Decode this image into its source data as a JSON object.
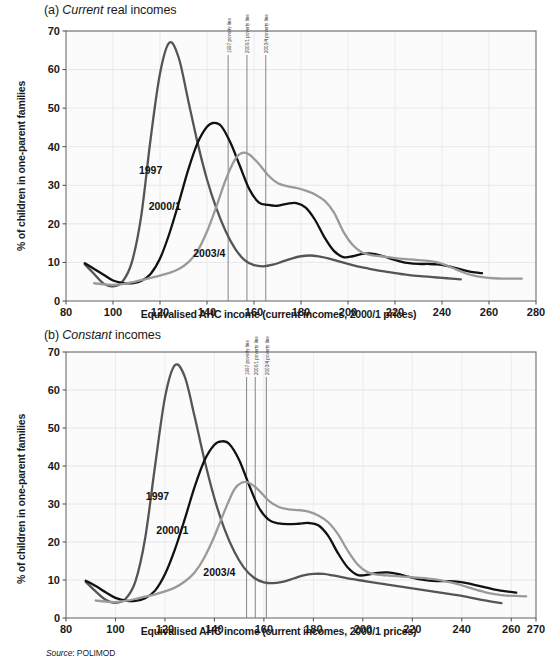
{
  "figure": {
    "source_prefix": "Source",
    "source_value": ": POLIMOD",
    "xlabel": "Equivalised AHC income (current incomes, 2000/1 prices)",
    "ylabel": "% of children in one-parent families"
  },
  "panels": [
    {
      "id": "a",
      "title_prefix": "(a) ",
      "title_italic": "Current",
      "title_rest": " real incomes"
    },
    {
      "id": "b",
      "title_prefix": "(b) ",
      "title_italic": "Constant",
      "title_rest": " incomes"
    }
  ],
  "chart_data": [
    {
      "type": "line",
      "title": "(a) Current real incomes",
      "xlabel": "Equivalised AHC income (current incomes, 2000/1 prices)",
      "ylabel": "% of children in one-parent families",
      "xlim": [
        80,
        280
      ],
      "ylim": [
        0,
        70
      ],
      "xticks": [
        80,
        100,
        120,
        140,
        160,
        180,
        200,
        220,
        240,
        260,
        280
      ],
      "yticks": [
        0,
        10,
        20,
        30,
        40,
        50,
        60,
        70
      ],
      "grid": true,
      "legend": "inline-labels",
      "annotations": [
        {
          "label": "1997 poverty line",
          "x": 149
        },
        {
          "label": "2000/1 poverty line",
          "x": 157
        },
        {
          "label": "2003/4 poverty line",
          "x": 165
        }
      ],
      "series": [
        {
          "name": "1997",
          "color": "#555555",
          "label_x": 116,
          "label_y": 33,
          "x": [
            88,
            92,
            96,
            100,
            104,
            108,
            112,
            116,
            120,
            124,
            128,
            132,
            136,
            140,
            144,
            148,
            152,
            156,
            160,
            164,
            168,
            172,
            176,
            180,
            184,
            188,
            192,
            196,
            200,
            204,
            208,
            212,
            216,
            220,
            224,
            228,
            232,
            236,
            240,
            244,
            248
          ],
          "y": [
            9.5,
            7.0,
            4.5,
            3.8,
            5.0,
            10.0,
            22.0,
            42.0,
            59.0,
            67.0,
            63.0,
            52.0,
            41.0,
            31.5,
            24.0,
            18.0,
            13.5,
            10.6,
            9.3,
            9.0,
            9.4,
            10.2,
            11.0,
            11.6,
            11.8,
            11.5,
            11.0,
            10.3,
            9.6,
            9.0,
            8.5,
            8.0,
            7.6,
            7.2,
            6.9,
            6.6,
            6.4,
            6.2,
            6.0,
            5.8,
            5.6
          ]
        },
        {
          "name": "2000/1",
          "color": "#111111",
          "label_x": 122,
          "label_y": 23.5,
          "x": [
            88,
            92,
            96,
            100,
            104,
            108,
            112,
            116,
            120,
            124,
            128,
            132,
            136,
            140,
            143,
            146,
            150,
            154,
            158,
            162,
            166,
            170,
            174,
            178,
            182,
            186,
            190,
            194,
            198,
            202,
            206,
            210,
            214,
            218,
            222,
            226,
            230,
            234,
            238,
            242,
            246,
            250,
            254,
            257
          ],
          "y": [
            9.8,
            8.3,
            6.8,
            5.3,
            4.7,
            4.6,
            5.2,
            7.0,
            11.0,
            17.5,
            25.5,
            34.0,
            41.0,
            45.2,
            46.2,
            45.4,
            41.0,
            35.0,
            29.0,
            25.6,
            24.9,
            24.7,
            25.2,
            25.4,
            24.2,
            21.0,
            16.5,
            13.0,
            11.4,
            11.6,
            12.2,
            12.3,
            11.8,
            11.0,
            10.3,
            9.8,
            9.6,
            9.6,
            9.5,
            9.1,
            8.5,
            7.9,
            7.4,
            7.2
          ]
        },
        {
          "name": "2003/4",
          "color": "#9a9a9a",
          "label_x": 141,
          "label_y": 11.5,
          "x": [
            92,
            96,
            100,
            104,
            108,
            112,
            116,
            120,
            124,
            128,
            132,
            136,
            140,
            144,
            148,
            152,
            155,
            158,
            162,
            166,
            170,
            174,
            178,
            182,
            186,
            190,
            194,
            198,
            202,
            206,
            210,
            214,
            218,
            222,
            226,
            230,
            234,
            238,
            242,
            246,
            250,
            254,
            258,
            262,
            266,
            270,
            274
          ],
          "y": [
            4.6,
            4.3,
            4.2,
            4.4,
            4.8,
            5.4,
            6.0,
            6.6,
            7.3,
            8.3,
            10.0,
            13.0,
            18.0,
            24.5,
            31.5,
            36.8,
            38.4,
            38.0,
            35.6,
            32.6,
            30.6,
            29.8,
            29.3,
            28.6,
            27.6,
            26.0,
            23.0,
            18.0,
            14.5,
            12.6,
            11.9,
            11.6,
            11.3,
            11.0,
            10.8,
            10.6,
            10.4,
            10.0,
            9.2,
            8.2,
            7.2,
            6.5,
            6.1,
            5.9,
            5.8,
            5.8,
            5.8
          ]
        }
      ]
    },
    {
      "type": "line",
      "title": "(b) Constant incomes",
      "xlabel": "Equivalised AHC income (current incomes, 2000/1 prices)",
      "ylabel": "% of children in one-parent families",
      "xlim": [
        80,
        270
      ],
      "ylim": [
        0,
        70
      ],
      "xticks": [
        80,
        100,
        120,
        140,
        160,
        180,
        200,
        220,
        240,
        260,
        270
      ],
      "yticks": [
        0,
        10,
        20,
        30,
        40,
        50,
        60,
        70
      ],
      "grid": true,
      "legend": "inline-labels",
      "annotations": [
        {
          "label": "1997 poverty line",
          "x": 153
        },
        {
          "label": "2000/1 poverty line",
          "x": 156.5
        },
        {
          "label": "2003/4 poverty line",
          "x": 161
        }
      ],
      "series": [
        {
          "name": "1997",
          "color": "#555555",
          "label_x": 117,
          "label_y": 31,
          "x": [
            88,
            92,
            96,
            100,
            104,
            108,
            112,
            116,
            120,
            124,
            128,
            132,
            136,
            140,
            144,
            148,
            152,
            156,
            160,
            164,
            168,
            172,
            176,
            180,
            184,
            188,
            192,
            196,
            200,
            204,
            208,
            212,
            216,
            220,
            224,
            228,
            232,
            236,
            240,
            244,
            248,
            252,
            256
          ],
          "y": [
            9.5,
            7.0,
            4.8,
            4.0,
            5.0,
            9.5,
            21.0,
            40.0,
            58.0,
            66.5,
            63.5,
            53.0,
            41.5,
            31.5,
            23.5,
            17.5,
            13.2,
            10.6,
            9.4,
            9.2,
            9.6,
            10.4,
            11.2,
            11.6,
            11.6,
            11.2,
            10.7,
            10.2,
            9.8,
            9.4,
            9.0,
            8.6,
            8.2,
            7.8,
            7.4,
            7.0,
            6.6,
            6.2,
            5.8,
            5.3,
            4.8,
            4.3,
            3.9
          ]
        },
        {
          "name": "2000/1",
          "color": "#111111",
          "label_x": 123,
          "label_y": 22,
          "x": [
            88,
            92,
            96,
            100,
            104,
            108,
            112,
            116,
            120,
            124,
            128,
            132,
            136,
            140,
            143,
            146,
            150,
            154,
            158,
            162,
            166,
            170,
            174,
            178,
            182,
            186,
            190,
            194,
            198,
            202,
            206,
            210,
            214,
            218,
            222,
            226,
            230,
            234,
            238,
            242,
            246,
            250,
            254,
            258,
            262
          ],
          "y": [
            9.8,
            8.4,
            6.8,
            5.3,
            4.6,
            4.5,
            5.2,
            7.2,
            11.5,
            18.0,
            26.0,
            34.5,
            41.5,
            45.6,
            46.5,
            45.8,
            41.6,
            35.0,
            29.0,
            25.8,
            24.9,
            24.7,
            24.8,
            25.0,
            24.4,
            21.6,
            17.0,
            13.2,
            11.3,
            11.4,
            11.9,
            12.0,
            11.6,
            10.9,
            10.3,
            9.9,
            9.7,
            9.7,
            9.6,
            9.2,
            8.6,
            8.0,
            7.4,
            7.0,
            6.7
          ]
        },
        {
          "name": "2003/4",
          "color": "#9a9a9a",
          "label_x": 142,
          "label_y": 11,
          "x": [
            92,
            96,
            100,
            104,
            108,
            112,
            116,
            120,
            124,
            128,
            132,
            136,
            140,
            144,
            148,
            151,
            154,
            158,
            162,
            166,
            170,
            174,
            178,
            182,
            186,
            190,
            194,
            198,
            202,
            206,
            210,
            214,
            218,
            222,
            226,
            230,
            234,
            238,
            242,
            246,
            250,
            254,
            258,
            262,
            266
          ],
          "y": [
            4.6,
            4.3,
            4.2,
            4.5,
            5.0,
            5.6,
            6.2,
            7.0,
            8.0,
            9.6,
            12.0,
            16.0,
            21.5,
            28.0,
            33.8,
            35.6,
            35.6,
            33.6,
            30.8,
            29.2,
            28.6,
            28.4,
            28.0,
            27.0,
            25.2,
            22.0,
            17.6,
            14.0,
            12.0,
            11.4,
            11.2,
            11.0,
            10.8,
            10.6,
            10.4,
            10.1,
            9.6,
            9.0,
            8.2,
            7.4,
            6.7,
            6.2,
            5.9,
            5.8,
            5.7
          ]
        }
      ]
    }
  ]
}
